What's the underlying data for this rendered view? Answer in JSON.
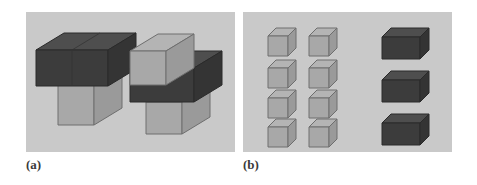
{
  "figure": {
    "type": "isometric-block-diagram",
    "background_color": "#ffffff",
    "panel_fill": "#c9c9c9",
    "light_block": {
      "top_face": "#b4b4b4",
      "left_face": "#a8a8a8",
      "right_face": "#9a9a9a",
      "edge": "#6e6e6e"
    },
    "dark_block": {
      "top_face": "#4e4e4e",
      "left_face": "#3c3c3c",
      "right_face": "#343434",
      "edge": "#2a2a2a"
    },
    "panels": [
      {
        "id": "panel-a",
        "label": "(a)",
        "caption_note": "assembled structures",
        "shapes": [
          {
            "name": "structure-left",
            "parts": [
              {
                "part": "dark-block-2x1",
                "color": "dark",
                "position": "top"
              },
              {
                "part": "light-cube",
                "color": "light",
                "position": "bottom-left-under"
              }
            ]
          },
          {
            "name": "structure-right",
            "parts": [
              {
                "part": "light-cube",
                "color": "light",
                "position": "top-left"
              },
              {
                "part": "dark-block-2x1",
                "color": "dark",
                "position": "middle"
              },
              {
                "part": "light-cube",
                "color": "light",
                "position": "bottom-center"
              }
            ]
          }
        ]
      },
      {
        "id": "panel-b",
        "label": "(b)",
        "caption_note": "component parts",
        "groups": [
          {
            "name": "light-cube-grid",
            "color": "light",
            "rows": 4,
            "columns": 2,
            "count": 8
          },
          {
            "name": "dark-block-column",
            "color": "dark",
            "rows": 3,
            "columns": 1,
            "count": 3
          }
        ]
      }
    ]
  }
}
